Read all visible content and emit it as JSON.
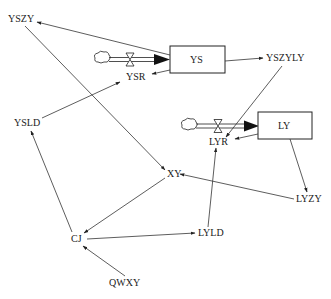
{
  "diagram": {
    "type": "system-dynamics stock-flow diagram",
    "stocks": [
      {
        "id": "YS",
        "label": "YS"
      },
      {
        "id": "LY",
        "label": "LY"
      }
    ],
    "flows": [
      {
        "id": "YSR",
        "label": "YSR",
        "into": "YS"
      },
      {
        "id": "LYR",
        "label": "LYR",
        "into": "LY"
      }
    ],
    "variables": [
      {
        "id": "YSZY",
        "label": "YSZY"
      },
      {
        "id": "YSZYLY",
        "label": "YSZYLY"
      },
      {
        "id": "YSLD",
        "label": "YSLD"
      },
      {
        "id": "XY",
        "label": "XY"
      },
      {
        "id": "LYZY",
        "label": "LYZY"
      },
      {
        "id": "CJ",
        "label": "CJ"
      },
      {
        "id": "LYLD",
        "label": "LYLD"
      },
      {
        "id": "QWXY",
        "label": "QWXY"
      }
    ],
    "links": [
      {
        "from": "YS",
        "to": "YSZY"
      },
      {
        "from": "YS",
        "to": "YSR"
      },
      {
        "from": "YS",
        "to": "YSZYLY"
      },
      {
        "from": "YSZYLY",
        "to": "LYR"
      },
      {
        "from": "YSZY",
        "to": "XY"
      },
      {
        "from": "YSLD",
        "to": "YSR"
      },
      {
        "from": "LY",
        "to": "LYR"
      },
      {
        "from": "LY",
        "to": "LYZY"
      },
      {
        "from": "LYZY",
        "to": "XY"
      },
      {
        "from": "XY",
        "to": "CJ"
      },
      {
        "from": "CJ",
        "to": "YSLD"
      },
      {
        "from": "CJ",
        "to": "LYLD"
      },
      {
        "from": "LYLD",
        "to": "LYR"
      },
      {
        "from": "QWXY",
        "to": "CJ"
      }
    ]
  }
}
